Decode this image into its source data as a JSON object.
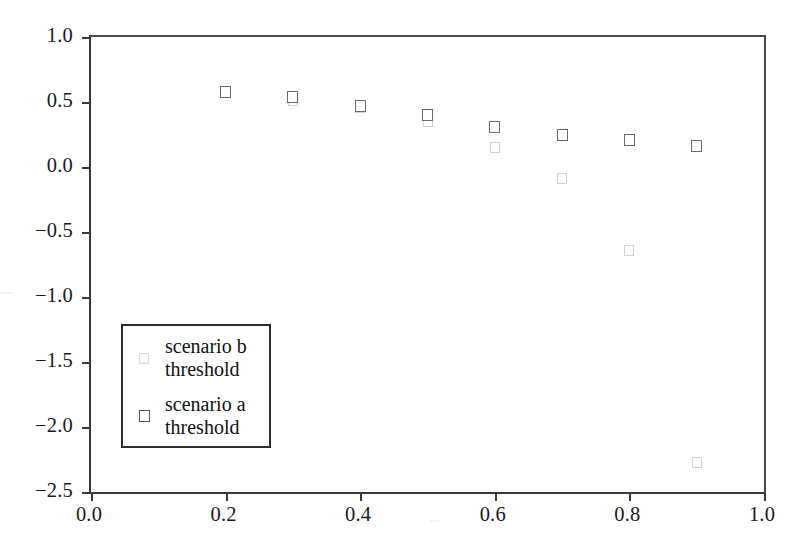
{
  "chart_data": {
    "type": "scatter",
    "title": "",
    "xlabel": "",
    "ylabel": "",
    "xlim": [
      0.0,
      1.0
    ],
    "ylim": [
      -2.5,
      1.0
    ],
    "xticks": [
      "0.0",
      "0.2",
      "0.4",
      "0.6",
      "0.8",
      "1.0"
    ],
    "xtick_values": [
      0.0,
      0.2,
      0.4,
      0.6,
      0.8,
      1.0
    ],
    "yticks": [
      "1.0",
      "0.5",
      "0.0",
      "−0.5",
      "−1.0",
      "−1.5",
      "−2.0",
      "−2.5"
    ],
    "ytick_values": [
      1.0,
      0.5,
      0.0,
      -0.5,
      -1.0,
      -1.5,
      -2.0,
      -2.5
    ],
    "grid": false,
    "legend_position": "center-left",
    "marker": "open-square",
    "series": [
      {
        "name": "scenario b\nthreshold",
        "key": "series-b",
        "color": "#d2d2d2",
        "x": [
          0.3,
          0.4,
          0.5,
          0.6,
          0.7,
          0.8,
          0.9
        ],
        "values": [
          0.51,
          0.46,
          0.35,
          0.15,
          -0.09,
          -0.64,
          -2.27
        ]
      },
      {
        "name": "scenario a\nthreshold",
        "key": "series-a",
        "color": "#6a6a6a",
        "x": [
          0.2,
          0.3,
          0.4,
          0.5,
          0.6,
          0.7,
          0.8,
          0.9
        ],
        "values": [
          0.58,
          0.54,
          0.47,
          0.4,
          0.31,
          0.25,
          0.21,
          0.16
        ]
      }
    ]
  },
  "legend": {
    "entries": [
      {
        "label": "scenario b\nthreshold",
        "swatch": "open-square-light",
        "series": "series-b"
      },
      {
        "label": "scenario a\nthreshold",
        "swatch": "open-square-dark",
        "series": "series-a"
      }
    ]
  },
  "axes": {
    "frame_color": "#3a3a3a",
    "background": "#ffffff"
  }
}
